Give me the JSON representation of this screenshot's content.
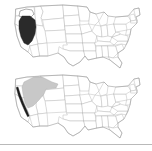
{
  "figure": {
    "width": 152,
    "height": 151,
    "background_color": "#ffffff",
    "panel_count": 2
  },
  "colors": {
    "background": "#ffffff",
    "state_border": "#b5b5b5",
    "nation_border": "#9a9a9a",
    "range_dark_fill": "#2a2a2a",
    "range_gray_fill": "#c8c8c8",
    "range_outline_fill": "#ffffff",
    "range_outline_stroke": "#5a5a5a",
    "caption_text": "#c9c9c9",
    "footer_rule": "#b9b9b9"
  },
  "panels": {
    "top": {
      "name": "upper-range-map",
      "caption": "",
      "base_map": "united-states-lower-48",
      "ranges": [
        {
          "id": "great-basin-core",
          "label": "",
          "fill": "#2a2a2a",
          "style": "solid-dark",
          "region": "Nevada and eastern California"
        },
        {
          "id": "northern-outline-patch",
          "label": "",
          "fill": "#ffffff",
          "style": "outline-only",
          "region": "Northern Nevada / southern Idaho"
        }
      ]
    },
    "bottom": {
      "name": "lower-range-map",
      "caption": "",
      "base_map": "united-states-lower-48",
      "ranges": [
        {
          "id": "pacific-northwest-interior",
          "label": "",
          "fill": "#c8c8c8",
          "style": "solid-gray",
          "region": "Washington, Oregon, Idaho, western Montana"
        },
        {
          "id": "california-coastal-strip",
          "label": "",
          "fill": "#1c1c1c",
          "style": "solid-dark-strip",
          "region": "California coast"
        }
      ]
    }
  },
  "footer": {
    "rule_visible": true
  }
}
